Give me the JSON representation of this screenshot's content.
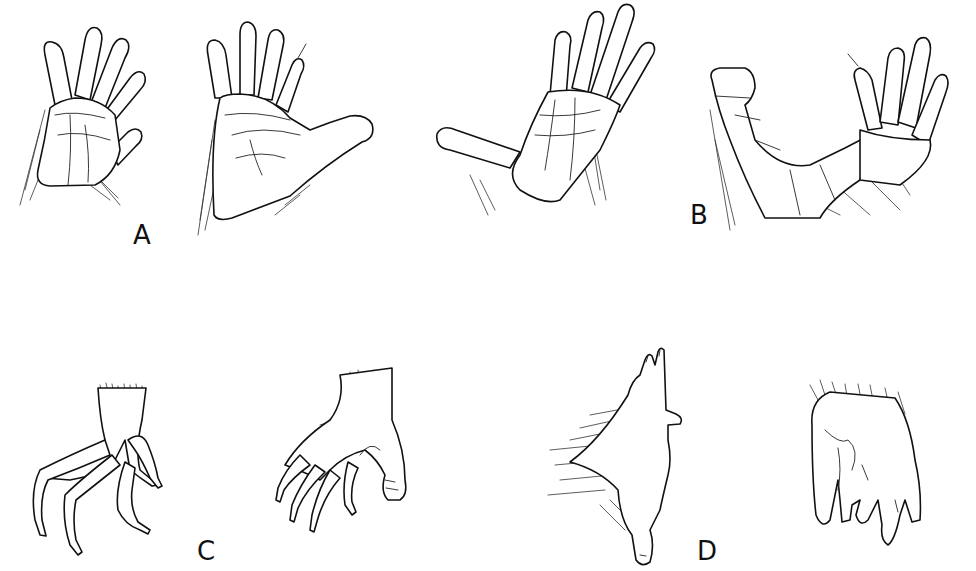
{
  "figure": {
    "title": "",
    "panels": [
      {
        "id": "A",
        "label": "A",
        "description": "Pair of hands, palmar view — broad palm, five fingers with rounded pads, thumb extended"
      },
      {
        "id": "B",
        "label": "B",
        "description": "Pair of hands, palmar view — long fingers, divergent thumb, wrinkled palm"
      },
      {
        "id": "C",
        "label": "C",
        "description": "Pair of hands, lateral view — slender clawed digits, hairy wrist"
      },
      {
        "id": "D",
        "label": "D",
        "description": "Pair of hands — dorsal view with reduced digits and hairy forearm; ventral view with curled fingers"
      }
    ]
  },
  "colors": {
    "ink": "#111111",
    "background": "#ffffff"
  }
}
